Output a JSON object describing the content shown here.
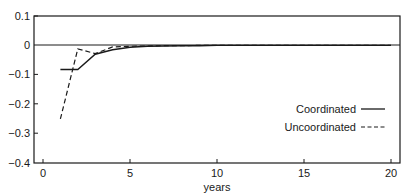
{
  "chart_data": {
    "type": "line",
    "title": "",
    "xlabel": "years",
    "ylabel": "",
    "xlim": [
      0,
      20
    ],
    "ylim": [
      -0.4,
      0.1
    ],
    "x_ticks": [
      0,
      5,
      10,
      15,
      20
    ],
    "y_ticks": [
      0.1,
      0,
      -0.1,
      -0.2,
      -0.3,
      -0.4
    ],
    "x_tick_labels": [
      "0",
      "5",
      "10",
      "15",
      "20"
    ],
    "y_tick_labels": [
      "0.1",
      "0",
      "-0.1",
      "-0.2",
      "-0.3",
      "-0.4"
    ],
    "grid": false,
    "reference_line": 0,
    "legend_position": "right-center inside",
    "series": [
      {
        "name": "Coordinated",
        "style": "solid",
        "x": [
          1,
          2,
          3,
          4,
          5,
          6,
          7,
          8,
          9,
          10,
          11,
          12,
          13,
          14,
          15,
          16,
          17,
          18,
          19,
          20
        ],
        "y": [
          -0.082,
          -0.082,
          -0.03,
          -0.015,
          -0.006,
          -0.003,
          -0.002,
          -0.001,
          -0.001,
          0,
          0,
          0,
          0,
          0,
          0,
          0,
          0,
          0,
          0,
          0
        ]
      },
      {
        "name": "Uncoordinated",
        "style": "dashed",
        "x": [
          1,
          2,
          3,
          4,
          5,
          6,
          7,
          8,
          9,
          10,
          11,
          12,
          13,
          14,
          15,
          16,
          17,
          18,
          19,
          20
        ],
        "y": [
          -0.25,
          -0.012,
          -0.028,
          -0.005,
          -0.003,
          -0.002,
          -0.001,
          -0.001,
          0,
          0,
          0,
          0,
          0,
          0,
          0,
          0,
          0,
          0,
          0,
          0
        ]
      }
    ]
  },
  "legend": {
    "coordinated": "Coordinated",
    "uncoordinated": "Uncoordinated"
  },
  "axes": {
    "xlabel": "years",
    "y_ticks": [
      "0.1",
      "0",
      "−0.1",
      "−0.2",
      "−0.3",
      "−0.4"
    ],
    "x_ticks": [
      "0",
      "5",
      "10",
      "15",
      "20"
    ]
  }
}
